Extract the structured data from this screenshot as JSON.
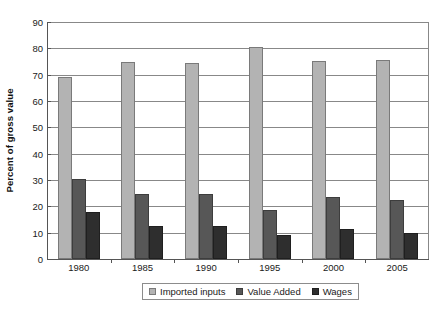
{
  "chart_data": {
    "type": "bar",
    "title": "",
    "subtitle": "",
    "xlabel": "",
    "ylabel": "Percent of gross value",
    "categories": [
      "1980",
      "1985",
      "1990",
      "1995",
      "2000",
      "2005"
    ],
    "series": [
      {
        "name": "Imported inputs",
        "color": "#b3b3b3",
        "values": [
          69,
          75,
          74.5,
          80.5,
          75.3,
          75.5
        ]
      },
      {
        "name": "Value Added",
        "color": "#575757",
        "values": [
          30.5,
          24.5,
          24.5,
          18.5,
          23.5,
          22.5
        ]
      },
      {
        "name": "Wages",
        "color": "#2e2e2e",
        "values": [
          18,
          12.5,
          12.5,
          9,
          11.5,
          10
        ]
      }
    ],
    "ylim": [
      0,
      90
    ],
    "ytick_step": 10,
    "yticks": [
      "0",
      "10",
      "20",
      "30",
      "40",
      "50",
      "60",
      "70",
      "80",
      "90"
    ],
    "grid": true,
    "legend_position": "bottom-center"
  },
  "caption": {
    "text": ""
  }
}
